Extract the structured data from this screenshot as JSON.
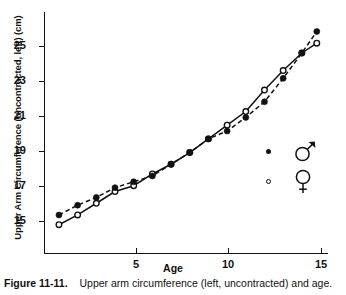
{
  "figure": {
    "caption_label": "Figure 11-11.",
    "caption_text": "Upper arm circumference (left, uncontracted) and age."
  },
  "chart_data": {
    "type": "line",
    "title": "",
    "xlabel": "Age",
    "ylabel": "Upper Arm Circumference (uncontracted, left) (cm)",
    "xlim": [
      0.2,
      15.4
    ],
    "ylim": [
      13.9,
      26.3
    ],
    "xticks": [
      5,
      10,
      15
    ],
    "yticks": [
      15,
      17,
      19,
      21,
      23,
      25
    ],
    "xtick_labels": [
      "5",
      "10",
      "15"
    ],
    "ytick_labels": [
      "15",
      "17",
      "19",
      "21",
      "23",
      "25"
    ],
    "grid": false,
    "legend_position": "inside-lower-right",
    "x": [
      1,
      2,
      3,
      4,
      5,
      6,
      7,
      8,
      9,
      10,
      11,
      12,
      13,
      14,
      14.8
    ],
    "series": [
      {
        "name": "male",
        "symbol": "filled-circle",
        "legend_glyph": "♂",
        "color": "#111111",
        "linestyle": "dashed",
        "values": [
          15.9,
          16.4,
          16.8,
          17.3,
          17.6,
          17.9,
          18.5,
          19.1,
          19.8,
          20.2,
          20.9,
          21.7,
          22.9,
          24.2,
          25.3
        ]
      },
      {
        "name": "female",
        "symbol": "open-circle",
        "legend_glyph": "♀",
        "color": "#111111",
        "linestyle": "solid",
        "values": [
          15.4,
          15.9,
          16.5,
          17.1,
          17.4,
          18.0,
          18.5,
          19.1,
          19.8,
          20.5,
          21.2,
          22.3,
          23.3,
          24.2,
          24.7
        ]
      }
    ]
  }
}
